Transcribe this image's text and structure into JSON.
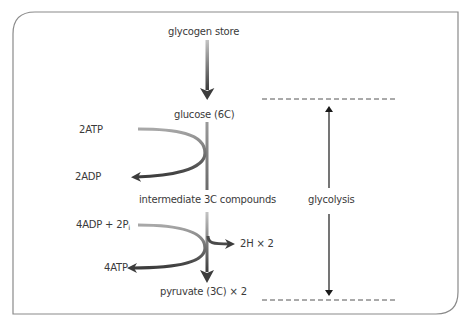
{
  "diagram": {
    "labels": {
      "glycogen_store": "glycogen store",
      "glucose": "glucose (6C)",
      "atp_in": "2ATP",
      "adp_out": "2ADP",
      "intermediate": "intermediate 3C compounds",
      "adp_pi_in_main": "4ADP + 2P",
      "adp_pi_in_sub": "i",
      "atp_out": "4ATP",
      "hydrogen": "2H × 2",
      "pyruvate": "pyruvate (3C) × 2",
      "stage_label": "glycolysis"
    },
    "colors": {
      "frame": "#8a8a8a",
      "arrow_light": "#b8b8b8",
      "arrow_dark": "#3c3c3c",
      "dashed": "#555555",
      "text": "#3a3a3a"
    }
  }
}
